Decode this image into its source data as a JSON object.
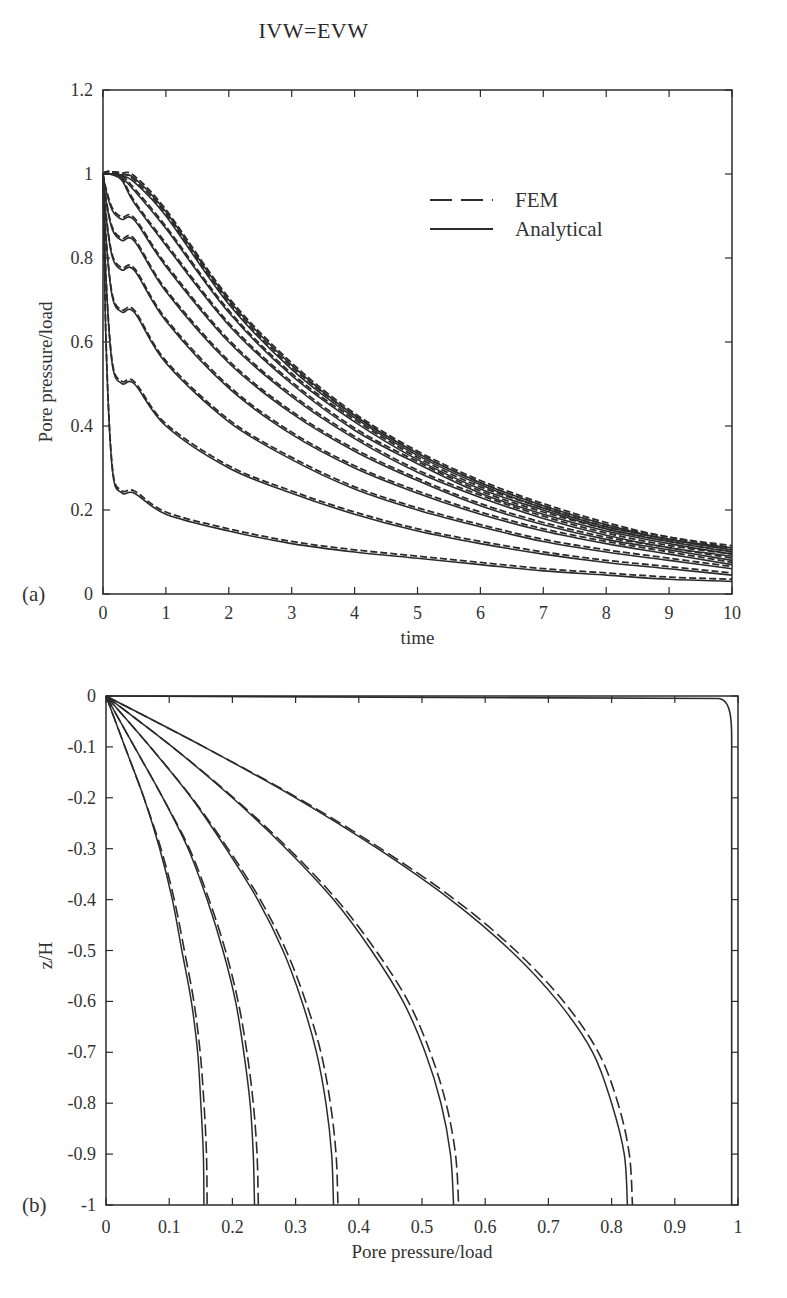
{
  "figure": {
    "title": "IVW=EVW",
    "caption_fragment": ""
  },
  "chart_data": [
    {
      "panel": "(a)",
      "type": "line",
      "title": "",
      "xlabel": "time",
      "ylabel": "Pore pressure/load",
      "xlim": [
        0,
        10
      ],
      "ylim": [
        0,
        1.2
      ],
      "xticks": [
        "0",
        "1",
        "2",
        "3",
        "4",
        "5",
        "6",
        "7",
        "8",
        "9",
        "10"
      ],
      "yticks": [
        "0",
        "0.2",
        "0.4",
        "0.6",
        "0.8",
        "1",
        "1.2"
      ],
      "grid": false,
      "legend": {
        "position": "upper right (inside)",
        "entries": [
          {
            "label": "FEM",
            "style": "dashed"
          },
          {
            "label": "Analytical",
            "style": "solid"
          }
        ]
      },
      "series_note": "Family of 10 decay curves (depth levels), each plotted as Analytical (solid) and FEM (dashed), all starting at 1 at t=0",
      "x": [
        0,
        0.5,
        1,
        2,
        3,
        4,
        5,
        6,
        7,
        8,
        9,
        10
      ],
      "series": [
        {
          "name": "curve-1",
          "values": [
            1.0,
            0.24,
            0.19,
            0.15,
            0.12,
            0.1,
            0.085,
            0.07,
            0.055,
            0.045,
            0.035,
            0.03
          ]
        },
        {
          "name": "curve-2",
          "values": [
            1.0,
            0.5,
            0.4,
            0.3,
            0.24,
            0.19,
            0.15,
            0.12,
            0.095,
            0.075,
            0.06,
            0.045
          ]
        },
        {
          "name": "curve-3",
          "values": [
            1.0,
            0.67,
            0.55,
            0.41,
            0.32,
            0.25,
            0.2,
            0.16,
            0.125,
            0.1,
            0.08,
            0.06
          ]
        },
        {
          "name": "curve-4",
          "values": [
            1.0,
            0.77,
            0.65,
            0.49,
            0.38,
            0.3,
            0.24,
            0.19,
            0.15,
            0.12,
            0.095,
            0.07
          ]
        },
        {
          "name": "curve-5",
          "values": [
            1.0,
            0.84,
            0.72,
            0.55,
            0.43,
            0.34,
            0.27,
            0.21,
            0.165,
            0.13,
            0.105,
            0.08
          ]
        },
        {
          "name": "curve-6",
          "values": [
            1.0,
            0.89,
            0.78,
            0.6,
            0.47,
            0.37,
            0.29,
            0.23,
            0.18,
            0.14,
            0.11,
            0.09
          ]
        },
        {
          "name": "curve-7",
          "values": [
            1.0,
            0.93,
            0.83,
            0.64,
            0.5,
            0.39,
            0.31,
            0.24,
            0.19,
            0.15,
            0.12,
            0.095
          ]
        },
        {
          "name": "curve-8",
          "values": [
            1.0,
            0.96,
            0.87,
            0.67,
            0.52,
            0.41,
            0.32,
            0.25,
            0.2,
            0.155,
            0.125,
            0.1
          ]
        },
        {
          "name": "curve-9",
          "values": [
            1.0,
            0.98,
            0.9,
            0.69,
            0.535,
            0.42,
            0.33,
            0.26,
            0.205,
            0.16,
            0.13,
            0.105
          ]
        },
        {
          "name": "curve-10",
          "values": [
            1.0,
            0.99,
            0.91,
            0.7,
            0.545,
            0.425,
            0.335,
            0.265,
            0.21,
            0.165,
            0.13,
            0.11
          ]
        }
      ]
    },
    {
      "panel": "(b)",
      "type": "line",
      "title": "",
      "xlabel": "Pore pressure/load",
      "ylabel": "z/H",
      "xlim": [
        0,
        1
      ],
      "ylim": [
        -1,
        0
      ],
      "xticks": [
        "0",
        "0.1",
        "0.2",
        "0.3",
        "0.4",
        "0.5",
        "0.6",
        "0.7",
        "0.8",
        "0.9",
        "1"
      ],
      "yticks": [
        "0",
        "-0.1",
        "-0.2",
        "-0.3",
        "-0.4",
        "-0.5",
        "-0.6",
        "-0.7",
        "-0.8",
        "-0.9",
        "-1"
      ],
      "grid": false,
      "series_note": "Isochrones; each time level plotted as Analytical (solid) and FEM (dashed). Values give pore pressure/load at each z/H.",
      "z": [
        0,
        -0.1,
        -0.2,
        -0.3,
        -0.4,
        -0.5,
        -0.6,
        -0.7,
        -0.8,
        -0.9,
        -1.0
      ],
      "series": [
        {
          "name": "analytical-t1",
          "values": [
            0,
            0.03,
            0.06,
            0.085,
            0.105,
            0.12,
            0.135,
            0.145,
            0.15,
            0.154,
            0.155
          ]
        },
        {
          "name": "fem-t1",
          "values": [
            0,
            0.03,
            0.06,
            0.087,
            0.108,
            0.124,
            0.139,
            0.149,
            0.155,
            0.159,
            0.16
          ]
        },
        {
          "name": "analytical-t2",
          "values": [
            0,
            0.045,
            0.09,
            0.13,
            0.16,
            0.185,
            0.205,
            0.218,
            0.228,
            0.233,
            0.235
          ]
        },
        {
          "name": "fem-t2",
          "values": [
            0,
            0.045,
            0.09,
            0.132,
            0.163,
            0.189,
            0.209,
            0.223,
            0.233,
            0.239,
            0.241
          ]
        },
        {
          "name": "analytical-t3",
          "values": [
            0,
            0.07,
            0.135,
            0.19,
            0.24,
            0.28,
            0.31,
            0.333,
            0.348,
            0.357,
            0.36
          ]
        },
        {
          "name": "fem-t3",
          "values": [
            0,
            0.07,
            0.136,
            0.193,
            0.244,
            0.285,
            0.316,
            0.34,
            0.355,
            0.364,
            0.367
          ]
        },
        {
          "name": "analytical-t4",
          "values": [
            0,
            0.105,
            0.2,
            0.285,
            0.36,
            0.42,
            0.47,
            0.505,
            0.53,
            0.545,
            0.55
          ]
        },
        {
          "name": "fem-t4",
          "values": [
            0,
            0.105,
            0.202,
            0.289,
            0.365,
            0.427,
            0.478,
            0.513,
            0.538,
            0.553,
            0.558
          ]
        },
        {
          "name": "analytical-t5",
          "values": [
            0,
            0.155,
            0.3,
            0.43,
            0.545,
            0.64,
            0.715,
            0.77,
            0.8,
            0.82,
            0.825
          ]
        },
        {
          "name": "fem-t5",
          "values": [
            0,
            0.155,
            0.303,
            0.435,
            0.552,
            0.648,
            0.724,
            0.779,
            0.81,
            0.828,
            0.833
          ]
        },
        {
          "name": "analytical-t0",
          "values": [
            0,
            0.975,
            0.985,
            0.99,
            0.99,
            0.99,
            0.99,
            0.99,
            0.99,
            0.99,
            0.99
          ]
        }
      ]
    }
  ],
  "panel_a": {
    "label": "(a)",
    "xlabel": "time",
    "ylabel": "Pore pressure/load",
    "legend": {
      "fem": "FEM",
      "analytical": "Analytical"
    }
  },
  "panel_b": {
    "label": "(b)",
    "xlabel": "Pore pressure/load",
    "ylabel": "z/H"
  }
}
